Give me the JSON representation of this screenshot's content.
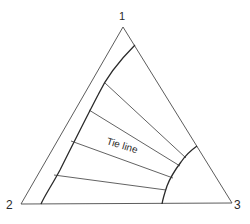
{
  "diagram": {
    "type": "ternary-phase-diagram",
    "vertices": [
      {
        "label": "1",
        "x": 123,
        "y": 27
      },
      {
        "label": "2",
        "x": 21,
        "y": 204
      },
      {
        "label": "3",
        "x": 232,
        "y": 203
      }
    ],
    "tie_line_label": "Tie line",
    "line_color": "#3a3a3a",
    "tie_lines": [
      {
        "x1": 105,
        "y1": 83,
        "x2": 186,
        "y2": 158
      },
      {
        "x1": 89,
        "y1": 110,
        "x2": 180,
        "y2": 166
      },
      {
        "x1": 71,
        "y1": 141,
        "x2": 173,
        "y2": 178
      },
      {
        "x1": 54,
        "y1": 175,
        "x2": 166,
        "y2": 190
      }
    ]
  }
}
